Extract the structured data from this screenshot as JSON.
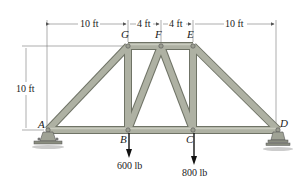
{
  "diagram": {
    "type": "truss",
    "nodes": {
      "A": {
        "label": "A"
      },
      "B": {
        "label": "B"
      },
      "C": {
        "label": "C"
      },
      "D": {
        "label": "D"
      },
      "E": {
        "label": "E"
      },
      "F": {
        "label": "F"
      },
      "G": {
        "label": "G"
      }
    },
    "members": [
      "AG",
      "AB",
      "BG",
      "BF",
      "FG",
      "FE",
      "FC",
      "BC",
      "CE",
      "CD",
      "ED"
    ],
    "dimensions": {
      "top_left": "10 ft",
      "top_mid_left": "4 ft",
      "top_mid_right": "4 ft",
      "top_right": "10 ft",
      "height": "10 ft"
    },
    "loads": [
      {
        "node": "B",
        "label": "600 lb",
        "direction": "down"
      },
      {
        "node": "C",
        "label": "800 lb",
        "direction": "down"
      }
    ],
    "supports": [
      {
        "node": "A",
        "type": "pin"
      },
      {
        "node": "D",
        "type": "roller"
      }
    ],
    "colors": {
      "member": "#a9ad9e",
      "member_edge": "#6f7366",
      "dimension": "#555555"
    }
  }
}
